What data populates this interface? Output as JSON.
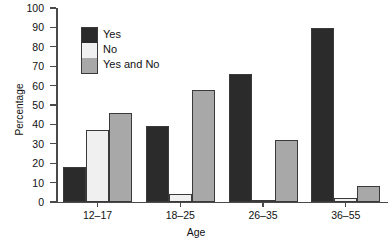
{
  "chart_data": {
    "type": "bar",
    "title": "",
    "xlabel": "Age",
    "ylabel": "Percentage",
    "categories": [
      "12–17",
      "18–25",
      "26–35",
      "36–55"
    ],
    "ylim": [
      0,
      100
    ],
    "ytick_step": 10,
    "yticks": [
      "100",
      "90",
      "80",
      "70",
      "60",
      "50",
      "40",
      "30",
      "20",
      "10",
      "0"
    ],
    "ytick_values": [
      100,
      90,
      80,
      70,
      60,
      50,
      40,
      30,
      20,
      10,
      0
    ],
    "grid": false,
    "legend_position": "upper-left-inside",
    "series": [
      {
        "name": "Yes",
        "color": "#2b2b2b",
        "values": [
          18,
          39,
          66,
          89.5
        ]
      },
      {
        "name": "No",
        "color": "#f0f0f0",
        "values": [
          37,
          4,
          1,
          2
        ]
      },
      {
        "name": "Yes and No",
        "color": "#a8a8a8",
        "values": [
          46,
          57.5,
          32,
          8.5
        ]
      }
    ]
  },
  "legend": {
    "items": [
      {
        "label": "Yes"
      },
      {
        "label": "No"
      },
      {
        "label": "Yes and No"
      }
    ]
  },
  "axes": {
    "y_title": "Percentage",
    "x_title": "Age"
  }
}
